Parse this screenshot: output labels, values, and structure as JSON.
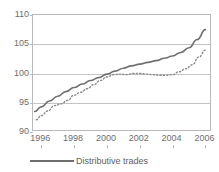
{
  "chart_data": {
    "type": "line",
    "title": "",
    "xlabel": "",
    "ylabel": "",
    "xlim": [
      1995.5,
      2006.4
    ],
    "ylim": [
      90,
      110
    ],
    "yticks": [
      90,
      95,
      100,
      105,
      110
    ],
    "xticks": [
      1996,
      1998,
      2000,
      2002,
      2004,
      2006
    ],
    "grid": true,
    "legend_position": "bottom-left",
    "series": [
      {
        "name": "Distributive trades",
        "style": "solid",
        "color": "#6f6f6f",
        "x": [
          1995.6,
          1996.0,
          1996.5,
          1997.0,
          1997.5,
          1998.0,
          1998.5,
          1999.0,
          1999.5,
          2000.0,
          2000.5,
          2001.0,
          2001.5,
          2002.0,
          2002.5,
          2003.0,
          2003.5,
          2004.0,
          2004.5,
          2005.0,
          2005.5,
          2006.0
        ],
        "values": [
          93.5,
          94.3,
          95.3,
          96.1,
          96.9,
          97.6,
          98.2,
          98.8,
          99.3,
          99.9,
          100.4,
          100.9,
          101.3,
          101.6,
          101.9,
          102.2,
          102.6,
          103.0,
          103.6,
          104.4,
          105.8,
          107.5
        ]
      },
      {
        "name": "second-series-dotted",
        "style": "dotted",
        "color": "#8a8a8a",
        "x": [
          1995.7,
          1996.0,
          1996.4,
          1996.8,
          1997.2,
          1997.6,
          1998.0,
          1998.4,
          1998.8,
          1999.2,
          1999.6,
          2000.0,
          2000.4,
          2000.8,
          2001.2,
          2001.6,
          2002.0,
          2002.4,
          2002.8,
          2003.2,
          2003.6,
          2004.0,
          2004.4,
          2004.8,
          2005.2,
          2005.6,
          2006.0
        ],
        "values": [
          92.1,
          92.8,
          93.6,
          94.5,
          94.8,
          95.4,
          96.3,
          96.8,
          97.4,
          98.1,
          98.8,
          99.4,
          99.8,
          99.9,
          99.8,
          100.0,
          100.0,
          99.9,
          99.8,
          99.7,
          99.7,
          99.8,
          100.3,
          100.8,
          101.5,
          102.8,
          104.0
        ]
      }
    ]
  },
  "axis": {
    "yticks": [
      "110",
      "105",
      "100",
      "95",
      "90"
    ],
    "xticks": [
      "1996",
      "1998",
      "2000",
      "2002",
      "2004",
      "2006"
    ]
  },
  "legend": {
    "items": [
      {
        "label": "Distributive trades"
      }
    ]
  }
}
